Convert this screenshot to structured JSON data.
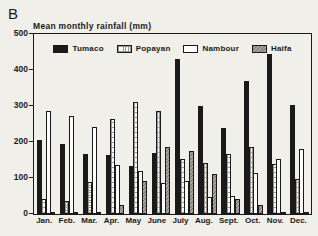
{
  "panel_label": "B",
  "chart_data": {
    "type": "bar",
    "title": "Mean monthly rainfall (mm)",
    "xlabel": "",
    "ylabel": "",
    "ylim": [
      0,
      500
    ],
    "yticks": [
      0,
      100,
      200,
      300,
      400,
      500
    ],
    "grid": false,
    "legend_position": "top-inside",
    "categories": [
      "Jan.",
      "Feb.",
      "Mar.",
      "Apr.",
      "May",
      "June",
      "July",
      "Aug.",
      "Sept.",
      "Oct.",
      "Nov.",
      "Dec."
    ],
    "series": [
      {
        "name": "Tumaco",
        "pattern": "solid-black",
        "color": "#1a1a1a",
        "values": [
          205,
          195,
          167,
          163,
          134,
          170,
          430,
          300,
          238,
          370,
          445,
          303
        ]
      },
      {
        "name": "Popayan",
        "pattern": "crosshatch-light",
        "color": "#fdfdfb",
        "values": [
          42,
          36,
          88,
          265,
          310,
          285,
          153,
          142,
          168,
          185,
          140,
          97
        ]
      },
      {
        "name": "Nambour",
        "pattern": "white",
        "color": "#fdfdfb",
        "values": [
          285,
          273,
          243,
          135,
          120,
          85,
          92,
          48,
          50,
          115,
          153,
          180
        ]
      },
      {
        "name": "Haifa",
        "pattern": "diagonal-gray",
        "color": "#a5a39c",
        "values": [
          2,
          2,
          2,
          26,
          93,
          185,
          175,
          110,
          42,
          25,
          6,
          2
        ]
      }
    ]
  }
}
